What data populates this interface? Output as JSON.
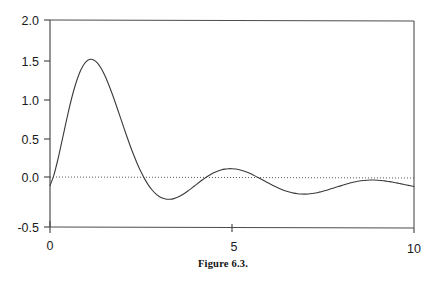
{
  "caption": "Figure 6.3.",
  "colors": {
    "axis": "#4d4d4d",
    "curve": "#3a3a3a",
    "zero_line": "#555555",
    "text": "#1a1a1a",
    "background": "#ffffff"
  },
  "chart_data": {
    "type": "line",
    "title": "",
    "subtitle": "",
    "xlabel": "",
    "ylabel": "",
    "xlim": [
      0,
      10
    ],
    "ylim": [
      -0.5,
      2.0
    ],
    "xticks": [
      0,
      5,
      10
    ],
    "xtick_labels": [
      "0",
      "5",
      "10"
    ],
    "yticks": [
      -0.5,
      0.0,
      0.5,
      1.0,
      1.5,
      2.0
    ],
    "ytick_labels": [
      "-0.5",
      "0.0",
      "0.5",
      "1.0",
      "1.5",
      "2.0"
    ],
    "grid": false,
    "legend": null,
    "annotations": [],
    "reference_lines": [
      {
        "name": "zero-line",
        "orientation": "horizontal",
        "value": 0.0,
        "style": "dotted"
      }
    ],
    "series": [
      {
        "name": "damped-oscillation",
        "style": "solid",
        "x": [
          0.0,
          0.1,
          0.2,
          0.3,
          0.4,
          0.5,
          0.6,
          0.7,
          0.8,
          0.9,
          1.0,
          1.1,
          1.2,
          1.3,
          1.4,
          1.5,
          1.6,
          1.7,
          1.8,
          1.9,
          2.0,
          2.1,
          2.2,
          2.3,
          2.4,
          2.5,
          2.6,
          2.7,
          2.8,
          2.9,
          3.0,
          3.1,
          3.2,
          3.3,
          3.4,
          3.5,
          3.6,
          3.7,
          3.8,
          3.9,
          4.0,
          4.1,
          4.2,
          4.3,
          4.4,
          4.5,
          4.6,
          4.7,
          4.8,
          4.9,
          5.0,
          5.1,
          5.2,
          5.3,
          5.4,
          5.5,
          5.6,
          5.7,
          5.8,
          5.9,
          6.0,
          6.1,
          6.2,
          6.3,
          6.4,
          6.5,
          6.6,
          6.7,
          6.8,
          6.9,
          7.0,
          7.1,
          7.2,
          7.3,
          7.4,
          7.5,
          7.6,
          7.7,
          7.8,
          7.9,
          8.0,
          8.1,
          8.2,
          8.3,
          8.4,
          8.5,
          8.6,
          8.7,
          8.8,
          8.9,
          9.0,
          9.1,
          9.2,
          9.3,
          9.4,
          9.5,
          9.6,
          9.7,
          9.8,
          9.9,
          10.0
        ],
        "y": [
          0.0,
          0.118,
          0.285,
          0.479,
          0.683,
          0.882,
          1.064,
          1.221,
          1.348,
          1.441,
          1.5,
          1.525,
          1.518,
          1.482,
          1.42,
          1.336,
          1.234,
          1.119,
          0.995,
          0.866,
          0.736,
          0.608,
          0.485,
          0.369,
          0.262,
          0.166,
          0.081,
          0.009,
          -0.05,
          -0.097,
          -0.131,
          -0.153,
          -0.164,
          -0.165,
          -0.157,
          -0.141,
          -0.119,
          -0.092,
          -0.061,
          -0.028,
          0.006,
          0.04,
          0.073,
          0.104,
          0.131,
          0.155,
          0.174,
          0.189,
          0.199,
          0.204,
          0.204,
          0.2,
          0.191,
          0.179,
          0.163,
          0.145,
          0.124,
          0.102,
          0.079,
          0.055,
          0.031,
          0.008,
          -0.014,
          -0.034,
          -0.052,
          -0.068,
          -0.081,
          -0.091,
          -0.098,
          -0.102,
          -0.103,
          -0.101,
          -0.096,
          -0.089,
          -0.079,
          -0.068,
          -0.056,
          -0.042,
          -0.028,
          -0.014,
          0.0,
          0.013,
          0.026,
          0.037,
          0.047,
          0.055,
          0.061,
          0.065,
          0.067,
          0.067,
          0.065,
          0.062,
          0.057,
          0.05,
          0.043,
          0.034,
          0.025,
          0.016,
          0.007,
          -0.002,
          -0.01
        ],
        "key_points": [
          {
            "label": "peak-1",
            "x": 1.4,
            "y": 1.67
          },
          {
            "label": "trough-1",
            "x": 3.0,
            "y": -0.11
          },
          {
            "label": "peak-2",
            "x": 3.5,
            "y": 0.6
          },
          {
            "label": "trough-2",
            "x": 4.3,
            "y": -0.07
          },
          {
            "label": "peak-3",
            "x": 4.8,
            "y": 0.28
          },
          {
            "label": "peak-4",
            "x": 5.9,
            "y": 0.16
          },
          {
            "label": "peak-5",
            "x": 7.0,
            "y": 0.09
          }
        ]
      }
    ]
  },
  "axes": {
    "x_axis_name": "x-axis",
    "y_axis_name": "y-axis",
    "frame": "open-left-top"
  }
}
